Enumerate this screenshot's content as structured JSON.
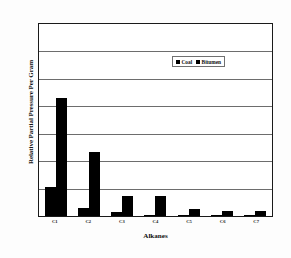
{
  "chart_data": {
    "type": "bar",
    "title": "",
    "xlabel": "Alkanes",
    "ylabel": "Relative Partial Pressure Per Gram",
    "categories": [
      "C1",
      "C2",
      "C3",
      "C4",
      "C5",
      "C6",
      "C7"
    ],
    "series": [
      {
        "name": "Coal",
        "values": [
          1.05,
          0.28,
          0.15,
          0.04,
          0.03,
          0.01,
          0.01
        ]
      },
      {
        "name": "Bitumen",
        "values": [
          4.3,
          2.35,
          0.72,
          0.72,
          0.27,
          0.2,
          0.18
        ]
      }
    ],
    "ylim": [
      0,
      7
    ],
    "yticks": [
      0,
      1,
      2,
      3,
      4,
      5,
      6,
      7
    ],
    "ytick_labels": [
      "",
      "",
      "",
      "",
      "",
      "",
      "",
      ""
    ],
    "grid": true,
    "gridline_count": 6,
    "legend_position": "upper right",
    "bar_color": "#000000",
    "frame_color": "#1a1a1a",
    "grid_color": "#6d6d6d",
    "background": "#ffffff"
  },
  "legend": {
    "entries": [
      {
        "label": "Coal",
        "swatch": "legend-swatch-coal"
      },
      {
        "label": "Bitumen",
        "swatch": "legend-swatch-bitumen"
      }
    ]
  },
  "axes": {
    "x_title": "Alkanes",
    "y_title": "Relative Partial Pressure Per Gram"
  }
}
